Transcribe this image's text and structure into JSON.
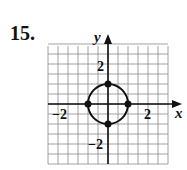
{
  "problem_number": "15.",
  "chart_data": {
    "type": "scatter",
    "title": "",
    "xlabel": "x",
    "ylabel": "y",
    "xlim": [
      -3,
      3
    ],
    "ylim": [
      -3,
      3
    ],
    "grid": true,
    "grid_step": 0.5,
    "x_tick_labels": [
      {
        "value": -2,
        "label": "−2"
      },
      {
        "value": 2,
        "label": "2"
      }
    ],
    "y_tick_labels": [
      {
        "value": 2,
        "label": "2"
      },
      {
        "value": -2,
        "label": "−2"
      }
    ],
    "curve": {
      "shape": "circle",
      "center": [
        0,
        0
      ],
      "radius": 1
    },
    "points": [
      {
        "x": 0,
        "y": 1
      },
      {
        "x": 1,
        "y": 0
      },
      {
        "x": 0,
        "y": -1
      },
      {
        "x": -1,
        "y": 0
      }
    ]
  }
}
